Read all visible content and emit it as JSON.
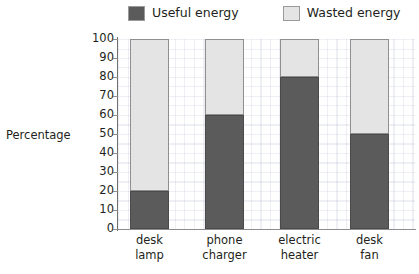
{
  "chart_data": {
    "type": "bar",
    "subtype": "stacked-bar-100-percent",
    "title": "",
    "subtitle": "",
    "xlabel": "",
    "ylabel": "Percentage",
    "ylim": [
      0,
      100
    ],
    "yticks": [
      0,
      10,
      20,
      30,
      40,
      50,
      60,
      70,
      80,
      90,
      100
    ],
    "ytick_labels": [
      "0",
      "10",
      "20",
      "30",
      "40",
      "50",
      "60",
      "70",
      "80",
      "90",
      "100"
    ],
    "grid": true,
    "grid_style": "fine dotted light-blue-grey",
    "legend_position": "top-center",
    "categories": [
      "desk lamp",
      "phone charger",
      "electric heater",
      "desk fan"
    ],
    "category_lines": [
      [
        "desk",
        "lamp"
      ],
      [
        "phone",
        "charger"
      ],
      [
        "electric",
        "heater"
      ],
      [
        "desk",
        "fan"
      ]
    ],
    "series": [
      {
        "name": "Useful energy",
        "color": "#5b5b5b",
        "values": [
          20,
          60,
          80,
          50
        ]
      },
      {
        "name": "Wasted energy",
        "color": "#e4e4e4",
        "values": [
          80,
          40,
          20,
          50
        ]
      }
    ]
  },
  "legend": {
    "entries": [
      {
        "label": "Useful energy",
        "color": "#5b5b5b"
      },
      {
        "label": "Wasted energy",
        "color": "#e4e4e4"
      }
    ]
  },
  "axis": {
    "y_title": "Percentage",
    "y_tick_labels": [
      "100",
      "90",
      "80",
      "70",
      "60",
      "50",
      "40",
      "30",
      "20",
      "10",
      "0"
    ]
  }
}
